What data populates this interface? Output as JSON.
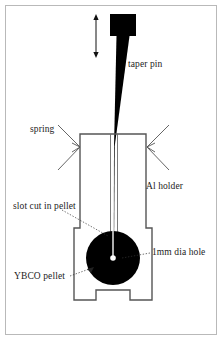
{
  "figure": {
    "labels": {
      "taper_pin": "taper pin",
      "spring": "spring",
      "al_holder": "Al holder",
      "slot_cut_in_pellet": "slot cut in pellet",
      "hole_diameter": "1mm dia hole",
      "ybco_pellet": "YBCO pellet"
    },
    "colors": {
      "ink": "#000000",
      "frame": "#b9b9b9",
      "outline": "#555555",
      "leader": "#333333",
      "background": "#ffffff"
    },
    "components": [
      {
        "name": "taper-pin",
        "description": "black tapered pin with rectangular head",
        "head": {
          "x": 110,
          "y": 14,
          "width": 26,
          "height": 22
        },
        "tip_y": 147
      },
      {
        "name": "motion-arrow",
        "description": "double headed vertical arrow showing pin travel",
        "x": 96,
        "y_top": 16,
        "y_bottom": 56
      },
      {
        "name": "al-holder",
        "description": "rectangular aluminium holder with central channel, side steps and bottom notch",
        "left": 78,
        "right": 148,
        "top": 134,
        "bottom": 300
      },
      {
        "name": "ybco-pellet",
        "description": "black circular pellet",
        "cx": 113,
        "cy": 258,
        "r": 27
      },
      {
        "name": "hole",
        "description": "1 mm diameter hole at pellet centre",
        "cx": 113,
        "cy": 258,
        "r": 2.6
      },
      {
        "name": "spring-left",
        "description": "arrow/chevron pressing holder from left"
      },
      {
        "name": "spring-right",
        "description": "arrow/chevron pressing holder from right"
      }
    ]
  }
}
